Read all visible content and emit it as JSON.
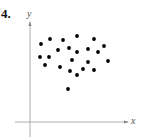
{
  "problem_number": "4.",
  "chart_data": {
    "type": "scatter",
    "title": "",
    "xlabel": "x",
    "ylabel": "y",
    "grid": false,
    "legend": null,
    "axis_origin_px": [
      30,
      122
    ],
    "points_px": [
      [
        41,
        44
      ],
      [
        50,
        39
      ],
      [
        63,
        40
      ],
      [
        77,
        36
      ],
      [
        94,
        39
      ],
      [
        104,
        46
      ],
      [
        58,
        50
      ],
      [
        69,
        48
      ],
      [
        77,
        52
      ],
      [
        88,
        49
      ],
      [
        98,
        52
      ],
      [
        40,
        57
      ],
      [
        49,
        57
      ],
      [
        72,
        60
      ],
      [
        88,
        62
      ],
      [
        108,
        61
      ],
      [
        45,
        65
      ],
      [
        60,
        67
      ],
      [
        70,
        71
      ],
      [
        83,
        69
      ],
      [
        94,
        70
      ],
      [
        77,
        75
      ],
      [
        68,
        89
      ]
    ],
    "points": [
      [
        11,
        78
      ],
      [
        20,
        83
      ],
      [
        33,
        82
      ],
      [
        47,
        86
      ],
      [
        64,
        83
      ],
      [
        74,
        76
      ],
      [
        28,
        72
      ],
      [
        39,
        74
      ],
      [
        47,
        70
      ],
      [
        58,
        73
      ],
      [
        68,
        70
      ],
      [
        10,
        65
      ],
      [
        19,
        65
      ],
      [
        42,
        62
      ],
      [
        58,
        60
      ],
      [
        78,
        61
      ],
      [
        15,
        57
      ],
      [
        30,
        55
      ],
      [
        40,
        51
      ],
      [
        53,
        53
      ],
      [
        64,
        52
      ],
      [
        47,
        47
      ],
      [
        38,
        33
      ]
    ],
    "note": "No tick marks or numeric scale shown; values are relative positions from origin (pixel units, y up)."
  },
  "axes": {
    "x_label": "x",
    "y_label": "y"
  }
}
